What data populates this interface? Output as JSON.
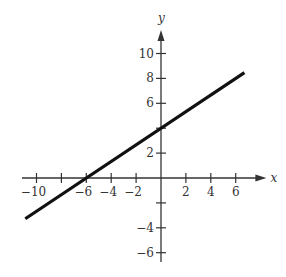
{
  "chart_data": {
    "type": "line",
    "title": "",
    "xlabel": "x",
    "ylabel": "y",
    "xlim": [
      -11,
      7.5
    ],
    "ylim": [
      -7,
      11.5
    ],
    "grid": false,
    "legend": null,
    "x_ticks": [
      -10,
      -8,
      -6,
      -4,
      -2,
      2,
      4,
      6
    ],
    "x_tick_labels": [
      "−10",
      "",
      "−6",
      "−4",
      "−2",
      "2",
      "4",
      "6"
    ],
    "y_ticks": [
      -6,
      -4,
      -2,
      2,
      4,
      6,
      8,
      10
    ],
    "y_tick_labels": [
      "−6",
      "−4",
      "",
      "2",
      "",
      "6",
      "8",
      "10"
    ],
    "series": [
      {
        "name": "line",
        "equation": "y = (2/3)x + 4",
        "slope": 0.6667,
        "intercept": 4,
        "x": [
          -10.9,
          6.7
        ],
        "y": [
          -3.27,
          8.47
        ],
        "color": "#111111"
      }
    ],
    "annotations": []
  },
  "colors": {
    "axis": "#333333",
    "line": "#111111",
    "background": "#ffffff"
  }
}
